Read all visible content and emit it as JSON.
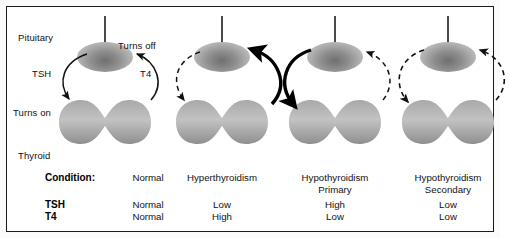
{
  "figure": {
    "background": "#ffffff",
    "frame_color": "#1a1a1a"
  },
  "labels": {
    "pituitary": "Pituitary",
    "thyroid": "Thyroid",
    "turns_on": "Turns on",
    "turns_off": "Turns off",
    "tsh": "TSH",
    "t4": "T4"
  },
  "panels": [
    {
      "name": "normal",
      "condition": "Normal",
      "subcondition": "",
      "tsh": "Normal",
      "t4": "Normal",
      "tsh_arrow": "solid-thin",
      "t4_arrow": "solid-thin"
    },
    {
      "name": "hyperthyroidism",
      "condition": "Hyperthyroidism",
      "subcondition": "",
      "tsh": "Low",
      "t4": "High",
      "tsh_arrow": "dashed",
      "t4_arrow": "solid-thick"
    },
    {
      "name": "hypothyroidism-primary",
      "condition": "Hypothyroidism",
      "subcondition": "Primary",
      "tsh": "High",
      "t4": "Low",
      "tsh_arrow": "solid-thick",
      "t4_arrow": "dashed"
    },
    {
      "name": "hypothyroidism-secondary",
      "condition": "Hypothyroidism",
      "subcondition": "Secondary",
      "tsh": "Low",
      "t4": "Low",
      "tsh_arrow": "dashed",
      "t4_arrow": "dashed"
    }
  ],
  "table": {
    "row_condition_label": "Condition:",
    "row_tsh_label": "TSH",
    "row_t4_label": "T4"
  }
}
